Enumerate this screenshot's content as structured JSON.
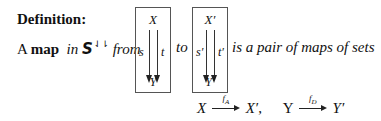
{
  "heading": "Definition:",
  "sentence": {
    "article": "A",
    "term": "map",
    "in_word": "in",
    "category_symbol": "S",
    "category_superscript": "⇃⇂",
    "from_word": "from",
    "to_word": "to",
    "tail": "is a pair of maps of sets"
  },
  "source_diagram": {
    "top_node": "X",
    "bottom_node": "Y",
    "left_arrow_label": "s",
    "right_arrow_label": "t"
  },
  "target_diagram": {
    "top_node": "X′",
    "bottom_node": "Y′",
    "left_arrow_label": "s′",
    "right_arrow_label": "t′"
  },
  "formula": {
    "map1": {
      "domain": "X",
      "function": "f",
      "function_sub": "A",
      "codomain": "X′"
    },
    "separator": ",",
    "map2": {
      "domain": "Y",
      "function": "f",
      "function_sub": "D",
      "codomain": "Y′"
    }
  }
}
